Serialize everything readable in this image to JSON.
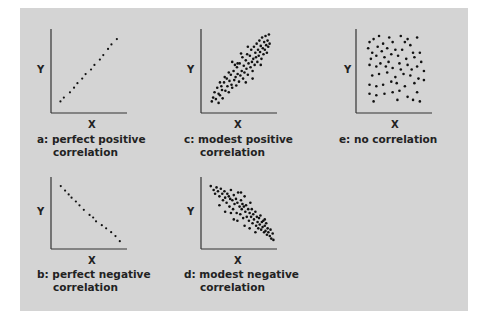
{
  "figure": {
    "background_color": "#d4d4d4",
    "axis_color": "#333333",
    "dot_color": "#111111"
  },
  "chart_data": [
    {
      "id": "a",
      "type": "scatter",
      "title": "a: perfect positive correlation",
      "caption_line1": "a: perfect positive",
      "caption_line2": "correlation",
      "xlabel": "X",
      "ylabel": "Y",
      "grid": false,
      "xlim": [
        0,
        100
      ],
      "ylim": [
        0,
        100
      ],
      "points": [
        [
          8,
          10
        ],
        [
          13,
          15
        ],
        [
          22,
          22
        ],
        [
          28,
          28
        ],
        [
          33,
          34
        ],
        [
          40,
          40
        ],
        [
          45,
          46
        ],
        [
          53,
          52
        ],
        [
          58,
          58
        ],
        [
          66,
          65
        ],
        [
          71,
          71
        ],
        [
          78,
          79
        ],
        [
          83,
          85
        ],
        [
          91,
          92
        ]
      ]
    },
    {
      "id": "b",
      "type": "scatter",
      "title": "b: perfect negative correlation",
      "caption_line1": "b: perfect negative",
      "caption_line2": "correlation",
      "xlabel": "X",
      "ylabel": "Y",
      "grid": false,
      "xlim": [
        0,
        100
      ],
      "ylim": [
        0,
        100
      ],
      "points": [
        [
          8,
          92
        ],
        [
          14,
          85
        ],
        [
          19,
          79
        ],
        [
          23,
          74
        ],
        [
          29,
          68
        ],
        [
          34,
          62
        ],
        [
          40,
          55
        ],
        [
          48,
          47
        ],
        [
          53,
          43
        ],
        [
          57,
          37
        ],
        [
          65,
          31
        ],
        [
          71,
          26
        ],
        [
          78,
          20
        ],
        [
          84,
          14
        ],
        [
          90,
          6
        ]
      ]
    },
    {
      "id": "c",
      "type": "scatter",
      "title": "c: modest positive correlation",
      "caption_line1": "c: modest positive",
      "caption_line2": "correlation",
      "xlabel": "X",
      "ylabel": "Y",
      "grid": false,
      "xlim": [
        0,
        100
      ],
      "ylim": [
        0,
        100
      ],
      "points": [
        [
          10,
          10
        ],
        [
          12,
          15
        ],
        [
          14,
          22
        ],
        [
          16,
          13
        ],
        [
          18,
          28
        ],
        [
          20,
          20
        ],
        [
          22,
          18
        ],
        [
          24,
          30
        ],
        [
          25,
          25
        ],
        [
          26,
          14
        ],
        [
          28,
          35
        ],
        [
          30,
          24
        ],
        [
          32,
          40
        ],
        [
          33,
          30
        ],
        [
          35,
          22
        ],
        [
          36,
          37
        ],
        [
          38,
          45
        ],
        [
          39,
          32
        ],
        [
          40,
          28
        ],
        [
          42,
          50
        ],
        [
          43,
          38
        ],
        [
          45,
          42
        ],
        [
          46,
          31
        ],
        [
          47,
          55
        ],
        [
          48,
          46
        ],
        [
          50,
          36
        ],
        [
          51,
          60
        ],
        [
          52,
          44
        ],
        [
          54,
          50
        ],
        [
          55,
          68
        ],
        [
          56,
          40
        ],
        [
          57,
          57
        ],
        [
          58,
          48
        ],
        [
          60,
          64
        ],
        [
          61,
          53
        ],
        [
          62,
          72
        ],
        [
          63,
          45
        ],
        [
          64,
          60
        ],
        [
          66,
          70
        ],
        [
          67,
          55
        ],
        [
          68,
          78
        ],
        [
          69,
          62
        ],
        [
          70,
          50
        ],
        [
          71,
          66
        ],
        [
          72,
          82
        ],
        [
          73,
          58
        ],
        [
          74,
          74
        ],
        [
          75,
          68
        ],
        [
          76,
          86
        ],
        [
          77,
          62
        ],
        [
          78,
          78
        ],
        [
          79,
          70
        ],
        [
          80,
          90
        ],
        [
          81,
          75
        ],
        [
          82,
          83
        ],
        [
          83,
          66
        ],
        [
          84,
          94
        ],
        [
          85,
          80
        ],
        [
          86,
          72
        ],
        [
          87,
          88
        ],
        [
          88,
          78
        ],
        [
          89,
          96
        ],
        [
          90,
          84
        ],
        [
          91,
          74
        ],
        [
          92,
          90
        ],
        [
          93,
          82
        ],
        [
          94,
          98
        ],
        [
          95,
          86
        ],
        [
          60,
          35
        ],
        [
          44,
          58
        ],
        [
          35,
          48
        ],
        [
          48,
          60
        ],
        [
          70,
          40
        ],
        [
          82,
          58
        ],
        [
          40,
          62
        ],
        [
          53,
          73
        ],
        [
          63,
          82
        ],
        [
          29,
          42
        ],
        [
          22,
          35
        ],
        [
          20,
          8
        ]
      ]
    },
    {
      "id": "d",
      "type": "scatter",
      "title": "d: modest negative correlation",
      "caption_line1": "d: modest negative",
      "caption_line2": "correlation",
      "xlabel": "X",
      "ylabel": "Y",
      "grid": false,
      "xlim": [
        0,
        100
      ],
      "ylim": [
        0,
        100
      ],
      "points": [
        [
          8,
          92
        ],
        [
          12,
          86
        ],
        [
          14,
          80
        ],
        [
          16,
          90
        ],
        [
          18,
          84
        ],
        [
          20,
          76
        ],
        [
          22,
          88
        ],
        [
          24,
          80
        ],
        [
          25,
          70
        ],
        [
          27,
          84
        ],
        [
          28,
          74
        ],
        [
          30,
          66
        ],
        [
          31,
          80
        ],
        [
          33,
          76
        ],
        [
          34,
          60
        ],
        [
          35,
          72
        ],
        [
          36,
          86
        ],
        [
          38,
          70
        ],
        [
          39,
          56
        ],
        [
          40,
          78
        ],
        [
          41,
          64
        ],
        [
          43,
          72
        ],
        [
          44,
          50
        ],
        [
          45,
          66
        ],
        [
          46,
          82
        ],
        [
          48,
          60
        ],
        [
          49,
          48
        ],
        [
          50,
          70
        ],
        [
          51,
          56
        ],
        [
          52,
          64
        ],
        [
          53,
          42
        ],
        [
          54,
          60
        ],
        [
          55,
          76
        ],
        [
          56,
          52
        ],
        [
          57,
          62
        ],
        [
          58,
          44
        ],
        [
          60,
          56
        ],
        [
          61,
          38
        ],
        [
          62,
          50
        ],
        [
          63,
          66
        ],
        [
          64,
          44
        ],
        [
          65,
          56
        ],
        [
          66,
          34
        ],
        [
          67,
          48
        ],
        [
          68,
          40
        ],
        [
          70,
          52
        ],
        [
          71,
          30
        ],
        [
          72,
          44
        ],
        [
          73,
          36
        ],
        [
          74,
          26
        ],
        [
          75,
          42
        ],
        [
          76,
          32
        ],
        [
          77,
          46
        ],
        [
          78,
          24
        ],
        [
          79,
          36
        ],
        [
          80,
          28
        ],
        [
          81,
          38
        ],
        [
          82,
          20
        ],
        [
          83,
          30
        ],
        [
          84,
          22
        ],
        [
          85,
          34
        ],
        [
          86,
          16
        ],
        [
          87,
          26
        ],
        [
          88,
          20
        ],
        [
          90,
          14
        ],
        [
          91,
          24
        ],
        [
          92,
          10
        ],
        [
          94,
          18
        ],
        [
          95,
          8
        ],
        [
          28,
          52
        ],
        [
          40,
          40
        ],
        [
          55,
          30
        ],
        [
          62,
          26
        ],
        [
          36,
          50
        ],
        [
          20,
          62
        ],
        [
          45,
          38
        ],
        [
          70,
          20
        ],
        [
          83,
          40
        ],
        [
          50,
          82
        ]
      ]
    },
    {
      "id": "e",
      "type": "scatter",
      "title": "e: no correlation",
      "caption_line1": "e: no correlation",
      "caption_line2": "",
      "xlabel": "X",
      "ylabel": "Y",
      "grid": false,
      "xlim": [
        0,
        100
      ],
      "ylim": [
        0,
        100
      ],
      "points": [
        [
          14,
          88
        ],
        [
          20,
          92
        ],
        [
          28,
          96
        ],
        [
          34,
          86
        ],
        [
          43,
          94
        ],
        [
          48,
          88
        ],
        [
          60,
          96
        ],
        [
          66,
          88
        ],
        [
          70,
          92
        ],
        [
          74,
          84
        ],
        [
          84,
          94
        ],
        [
          12,
          80
        ],
        [
          18,
          74
        ],
        [
          26,
          82
        ],
        [
          32,
          76
        ],
        [
          40,
          80
        ],
        [
          52,
          78
        ],
        [
          62,
          78
        ],
        [
          78,
          74
        ],
        [
          88,
          74
        ],
        [
          16,
          66
        ],
        [
          24,
          70
        ],
        [
          36,
          68
        ],
        [
          46,
          72
        ],
        [
          56,
          70
        ],
        [
          68,
          66
        ],
        [
          80,
          68
        ],
        [
          90,
          62
        ],
        [
          14,
          58
        ],
        [
          24,
          56
        ],
        [
          38,
          56
        ],
        [
          48,
          54
        ],
        [
          58,
          60
        ],
        [
          70,
          58
        ],
        [
          84,
          56
        ],
        [
          94,
          50
        ],
        [
          18,
          44
        ],
        [
          28,
          46
        ],
        [
          40,
          48
        ],
        [
          52,
          42
        ],
        [
          64,
          46
        ],
        [
          74,
          44
        ],
        [
          86,
          40
        ],
        [
          14,
          32
        ],
        [
          24,
          30
        ],
        [
          34,
          32
        ],
        [
          46,
          36
        ],
        [
          54,
          34
        ],
        [
          66,
          30
        ],
        [
          80,
          34
        ],
        [
          94,
          38
        ],
        [
          14,
          20
        ],
        [
          24,
          18
        ],
        [
          36,
          20
        ],
        [
          48,
          22
        ],
        [
          58,
          24
        ],
        [
          70,
          16
        ],
        [
          78,
          12
        ],
        [
          84,
          22
        ],
        [
          88,
          10
        ],
        [
          30,
          60
        ],
        [
          60,
          52
        ],
        [
          42,
          62
        ],
        [
          76,
          52
        ],
        [
          20,
          10
        ],
        [
          55,
          12
        ]
      ]
    }
  ]
}
